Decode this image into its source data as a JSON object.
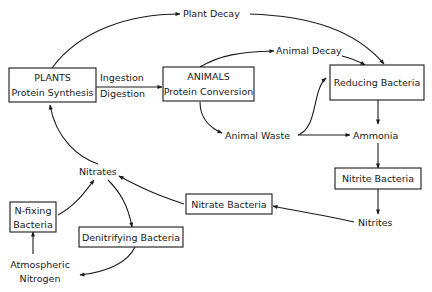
{
  "diagram": {
    "colors": {
      "ink": "#1a1a1a",
      "background": "#ffffff"
    },
    "nodes": {
      "plants": {
        "line1": "PLANTS",
        "line2": "Protein Synthesis"
      },
      "animals": {
        "line1": "ANIMALS",
        "line2": "Protein Conversion"
      },
      "reducing_bacteria": {
        "label": "Reducing Bacteria"
      },
      "nitrite_bacteria": {
        "label": "Nitrite Bacteria"
      },
      "nitrate_bacteria": {
        "label": "Nitrate Bacteria"
      },
      "n_fixing_bacteria": {
        "line1": "N-fixing",
        "line2": "Bacteria"
      },
      "denitrifying_bacteria": {
        "label": "Denitrifying Bacteria"
      },
      "plant_decay": {
        "label": "Plant Decay"
      },
      "animal_decay": {
        "label": "Animal Decay"
      },
      "animal_waste": {
        "label": "Animal Waste"
      },
      "ammonia": {
        "label": "Ammonia"
      },
      "nitrites": {
        "label": "Nitrites"
      },
      "nitrates": {
        "label": "Nitrates"
      },
      "atmospheric_nitrogen": {
        "line1": "Atmospheric",
        "line2": "Nitrogen"
      }
    },
    "edge_labels": {
      "ingestion": "Ingestion",
      "digestion": "Digestion"
    },
    "edges": [
      {
        "from": "PLANTS",
        "to": "Plant Decay"
      },
      {
        "from": "Plant Decay",
        "to": "Reducing Bacteria"
      },
      {
        "from": "PLANTS",
        "to": "ANIMALS",
        "label": "Ingestion / Digestion"
      },
      {
        "from": "ANIMALS",
        "to": "Animal Decay"
      },
      {
        "from": "Animal Decay",
        "to": "Reducing Bacteria"
      },
      {
        "from": "ANIMALS",
        "to": "Animal Waste"
      },
      {
        "from": "Animal Waste",
        "to": "Reducing Bacteria"
      },
      {
        "from": "Animal Waste",
        "to": "Ammonia"
      },
      {
        "from": "Reducing Bacteria",
        "to": "Ammonia"
      },
      {
        "from": "Ammonia",
        "to": "Nitrite Bacteria"
      },
      {
        "from": "Nitrite Bacteria",
        "to": "Nitrites"
      },
      {
        "from": "Nitrites",
        "to": "Nitrate Bacteria"
      },
      {
        "from": "Nitrate Bacteria",
        "to": "Nitrates"
      },
      {
        "from": "Nitrates",
        "to": "PLANTS"
      },
      {
        "from": "Nitrates",
        "to": "Denitrifying Bacteria"
      },
      {
        "from": "Denitrifying Bacteria",
        "to": "Atmospheric Nitrogen"
      },
      {
        "from": "Atmospheric Nitrogen",
        "to": "N-fixing Bacteria"
      },
      {
        "from": "N-fixing Bacteria",
        "to": "Nitrates"
      }
    ]
  }
}
